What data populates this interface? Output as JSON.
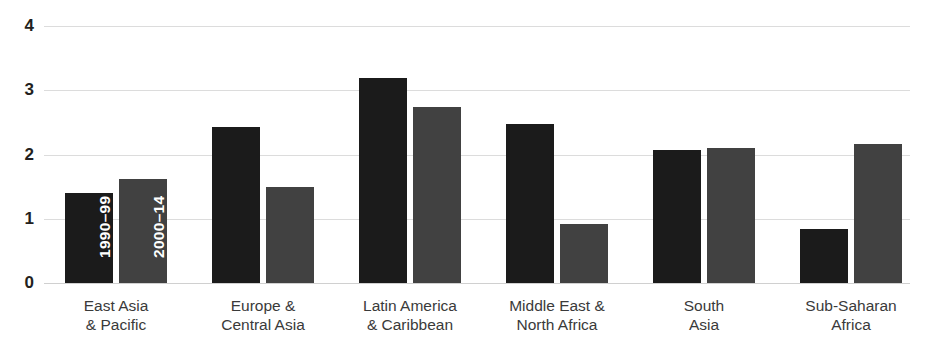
{
  "chart_data": {
    "type": "bar",
    "title": "",
    "subtitle": "",
    "xlabel": "",
    "ylabel": "",
    "ylim": [
      0,
      4
    ],
    "yticks": [
      "0",
      "1",
      "2",
      "3",
      "4"
    ],
    "grid": true,
    "legend_position": "in-bar (first group)",
    "categories": [
      {
        "line1": "East Asia",
        "line2": "& Pacific"
      },
      {
        "line1": "Europe &",
        "line2": "Central Asia"
      },
      {
        "line1": "Latin America",
        "line2": "& Caribbean"
      },
      {
        "line1": "Middle East &",
        "line2": "North Africa"
      },
      {
        "line1": "South",
        "line2": "Asia"
      },
      {
        "line1": "Sub-Saharan",
        "line2": "Africa"
      }
    ],
    "series": [
      {
        "name": "1990–99",
        "color": "#1b1b1b",
        "values": [
          1.4,
          2.43,
          3.19,
          2.47,
          2.07,
          0.84
        ]
      },
      {
        "name": "2000–14",
        "color": "#414141",
        "values": [
          1.62,
          1.5,
          2.74,
          0.92,
          2.1,
          2.17
        ]
      }
    ],
    "inbar_labels": [
      "1990–99",
      "2000–14"
    ],
    "axis_colors": {
      "gridline": "#dcdcdc",
      "tick_text": "#231f20",
      "category_text": "#3a3a3a"
    }
  }
}
